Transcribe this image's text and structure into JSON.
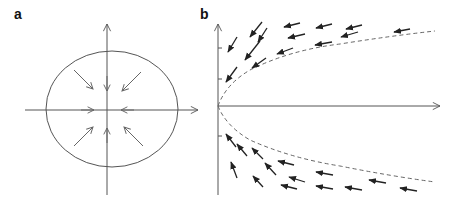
{
  "panels": [
    {
      "label": "a",
      "description": "Stable node phase portrait: all arrows point inward toward origin, enclosed by an ellipse",
      "axes": {
        "origin": [
          107,
          110
        ],
        "x_range": [
          25,
          198
        ],
        "y_range": [
          24,
          195
        ]
      },
      "ellipse": {
        "cx": 112,
        "cy": 109,
        "rx": 66,
        "ry": 58
      },
      "arrows": [
        {
          "from": [
            74,
            70
          ],
          "to": [
            93,
            89
          ]
        },
        {
          "from": [
            107,
            76
          ],
          "to": [
            107,
            91
          ]
        },
        {
          "from": [
            141,
            72
          ],
          "to": [
            122,
            91
          ]
        },
        {
          "from": [
            81,
            110
          ],
          "to": [
            94,
            110
          ]
        },
        {
          "from": [
            134,
            110
          ],
          "to": [
            121,
            110
          ]
        },
        {
          "from": [
            74,
            146
          ],
          "to": [
            93,
            127
          ]
        },
        {
          "from": [
            107,
            143
          ],
          "to": [
            107,
            128
          ]
        },
        {
          "from": [
            143,
            146
          ],
          "to": [
            124,
            127
          ]
        }
      ]
    },
    {
      "label": "b",
      "description": "Saddle-node / parabolic separatrix phase portrait with flow arrows pointing left toward y-axis",
      "axes": {
        "origin": [
          218,
          106
        ],
        "x_end": 440,
        "y_top": 24,
        "y_bottom": 195
      },
      "ticks_y": [
        48,
        79,
        136
      ],
      "separatrix": "dashed parabola x proportional to y^2 opening right",
      "arrows_upper": [
        {
          "from": [
            262,
            22
          ],
          "to": [
            250,
            37
          ]
        },
        {
          "from": [
            237,
            37
          ],
          "to": [
            228,
            52
          ]
        },
        {
          "from": [
            267,
            28
          ],
          "to": [
            258,
            42
          ]
        },
        {
          "from": [
            300,
            23
          ],
          "to": [
            284,
            27
          ]
        },
        {
          "from": [
            332,
            24
          ],
          "to": [
            316,
            28
          ]
        },
        {
          "from": [
            362,
            25
          ],
          "to": [
            346,
            29
          ]
        },
        {
          "from": [
            410,
            29
          ],
          "to": [
            394,
            32
          ]
        },
        {
          "from": [
            260,
            41
          ],
          "to": [
            245,
            60
          ]
        },
        {
          "from": [
            305,
            34
          ],
          "to": [
            288,
            38
          ]
        },
        {
          "from": [
            358,
            32
          ],
          "to": [
            341,
            37
          ]
        },
        {
          "from": [
            237,
            67
          ],
          "to": [
            226,
            82
          ]
        },
        {
          "from": [
            266,
            58
          ],
          "to": [
            252,
            68
          ]
        },
        {
          "from": [
            293,
            48
          ],
          "to": [
            277,
            54
          ]
        },
        {
          "from": [
            332,
            42
          ],
          "to": [
            315,
            45
          ]
        }
      ],
      "arrows_lower": [
        {
          "from": [
            236,
            147
          ],
          "to": [
            226,
            134
          ]
        },
        {
          "from": [
            247,
            156
          ],
          "to": [
            237,
            144
          ]
        },
        {
          "from": [
            263,
            159
          ],
          "to": [
            252,
            148
          ]
        },
        {
          "from": [
            237,
            178
          ],
          "to": [
            231,
            162
          ]
        },
        {
          "from": [
            263,
            187
          ],
          "to": [
            253,
            176
          ]
        },
        {
          "from": [
            276,
            175
          ],
          "to": [
            265,
            163
          ]
        },
        {
          "from": [
            294,
            165
          ],
          "to": [
            278,
            161
          ]
        },
        {
          "from": [
            305,
            182
          ],
          "to": [
            289,
            177
          ]
        },
        {
          "from": [
            333,
            175
          ],
          "to": [
            316,
            172
          ]
        },
        {
          "from": [
            297,
            189
          ],
          "to": [
            281,
            185
          ]
        },
        {
          "from": [
            333,
            189
          ],
          "to": [
            316,
            186
          ]
        },
        {
          "from": [
            362,
            190
          ],
          "to": [
            345,
            187
          ]
        },
        {
          "from": [
            386,
            183
          ],
          "to": [
            369,
            180
          ]
        },
        {
          "from": [
            417,
            191
          ],
          "to": [
            400,
            188
          ]
        }
      ]
    }
  ],
  "colors": {
    "axis": "#555555",
    "ellipse": "#555555",
    "arrow_a": "#666666",
    "arrow_b": "#222222",
    "dash": "#666666"
  }
}
